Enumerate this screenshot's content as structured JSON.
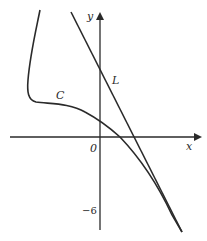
{
  "diagram": {
    "type": "coordinate-sketch",
    "background": "#ffffff",
    "stroke_color": "#2a2a2a",
    "axes": {
      "x_label": "x",
      "y_label": "y",
      "origin_label": "0",
      "y_tick_label": "−6"
    },
    "curves": [
      {
        "name": "C",
        "label": "C",
        "kind": "curve"
      },
      {
        "name": "L",
        "label": "L",
        "kind": "straight-line"
      }
    ]
  }
}
